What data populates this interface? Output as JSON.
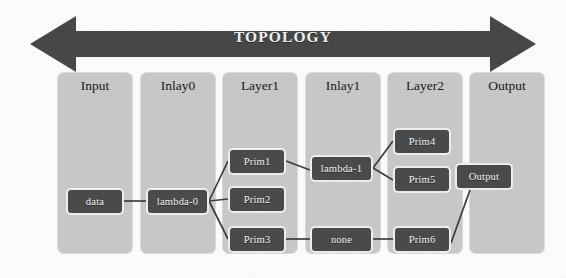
{
  "diagram": {
    "title": "TOPOLOGY",
    "arrow": {
      "name": "topology-double-arrow",
      "direction": "double",
      "color": "#484848"
    },
    "colors": {
      "column_background": "#c9c9c9",
      "node_fill": "#4b4b4b",
      "node_border": "#efefef",
      "node_text": "#f4f4f4",
      "edge": "#3d3d3d",
      "canvas": "#fdfdfd"
    },
    "columns": [
      {
        "id": "input",
        "label": "Input",
        "x": 57,
        "width": 76
      },
      {
        "id": "inlay0",
        "label": "Inlay0",
        "x": 140,
        "width": 76
      },
      {
        "id": "layer1",
        "label": "Layer1",
        "x": 222,
        "width": 76
      },
      {
        "id": "inlay1",
        "label": "Inlay1",
        "x": 305,
        "width": 76
      },
      {
        "id": "layer2",
        "label": "Layer2",
        "x": 387,
        "width": 76
      },
      {
        "id": "output",
        "label": "Output",
        "x": 469,
        "width": 76
      }
    ],
    "nodes": [
      {
        "id": "data",
        "label": "data",
        "column": "input",
        "x": 66,
        "y": 188,
        "w": 58,
        "h": 27
      },
      {
        "id": "lambda0",
        "label": "lambda-0",
        "column": "inlay0",
        "x": 146,
        "y": 188,
        "w": 63,
        "h": 27
      },
      {
        "id": "prim1",
        "label": "Prim1",
        "column": "layer1",
        "x": 228,
        "y": 148,
        "w": 58,
        "h": 27
      },
      {
        "id": "prim2",
        "label": "Prim2",
        "column": "layer1",
        "x": 228,
        "y": 186,
        "w": 58,
        "h": 27
      },
      {
        "id": "prim3",
        "label": "Prim3",
        "column": "layer1",
        "x": 228,
        "y": 226,
        "w": 58,
        "h": 27
      },
      {
        "id": "lambda1",
        "label": "lambda-1",
        "column": "inlay1",
        "x": 310,
        "y": 155,
        "w": 63,
        "h": 27
      },
      {
        "id": "none",
        "label": "none",
        "column": "inlay1",
        "x": 310,
        "y": 226,
        "w": 63,
        "h": 27
      },
      {
        "id": "prim4",
        "label": "Prim4",
        "column": "layer2",
        "x": 393,
        "y": 128,
        "w": 58,
        "h": 27
      },
      {
        "id": "prim5",
        "label": "Prim5",
        "column": "layer2",
        "x": 393,
        "y": 166,
        "w": 58,
        "h": 27
      },
      {
        "id": "prim6",
        "label": "Prim6",
        "column": "layer2",
        "x": 393,
        "y": 226,
        "w": 58,
        "h": 27
      },
      {
        "id": "output",
        "label": "Output",
        "column": "output",
        "x": 455,
        "y": 163,
        "w": 58,
        "h": 27
      }
    ],
    "edges": [
      {
        "from": "data",
        "to": "lambda0",
        "x1": 124,
        "y1": 201,
        "x2": 146,
        "y2": 201
      },
      {
        "from": "lambda0",
        "to": "prim1",
        "x1": 209,
        "y1": 201,
        "x2": 228,
        "y2": 161
      },
      {
        "from": "lambda0",
        "to": "prim2",
        "x1": 209,
        "y1": 201,
        "x2": 228,
        "y2": 199
      },
      {
        "from": "lambda0",
        "to": "prim3",
        "x1": 209,
        "y1": 201,
        "x2": 228,
        "y2": 239
      },
      {
        "from": "prim1",
        "to": "lambda1",
        "x1": 286,
        "y1": 161,
        "x2": 310,
        "y2": 170
      },
      {
        "from": "lambda1",
        "to": "prim4",
        "x1": 373,
        "y1": 168,
        "x2": 393,
        "y2": 141
      },
      {
        "from": "lambda1",
        "to": "prim5",
        "x1": 373,
        "y1": 168,
        "x2": 393,
        "y2": 180
      },
      {
        "from": "prim3",
        "to": "none",
        "x1": 286,
        "y1": 239,
        "x2": 310,
        "y2": 239
      },
      {
        "from": "none",
        "to": "prim6",
        "x1": 373,
        "y1": 239,
        "x2": 393,
        "y2": 239
      },
      {
        "from": "prim6",
        "to": "output",
        "x1": 451,
        "y1": 243,
        "x2": 470,
        "y2": 190
      }
    ]
  }
}
